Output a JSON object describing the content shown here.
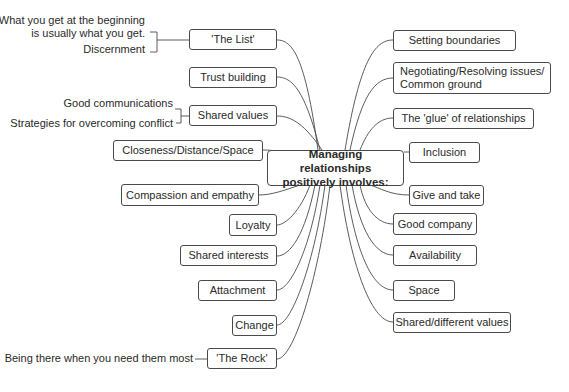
{
  "center": {
    "line1": "Managing relationships",
    "line2": "positively involves:"
  },
  "left_nodes": [
    {
      "label": "'The List'"
    },
    {
      "label": "Trust building"
    },
    {
      "label": "Shared values"
    },
    {
      "label": "Closeness/Distance/Space"
    },
    {
      "label": "Compassion and empathy"
    },
    {
      "label": "Loyalty"
    },
    {
      "label": "Shared interests"
    },
    {
      "label": "Attachment"
    },
    {
      "label": "Change"
    },
    {
      "label": "'The Rock'"
    }
  ],
  "right_nodes": [
    {
      "label": "Setting boundaries"
    },
    {
      "label": "Negotiating/Resolving issues/ Common ground"
    },
    {
      "label": "The 'glue' of relationships"
    },
    {
      "label": "Inclusion"
    },
    {
      "label": "Give and take"
    },
    {
      "label": "Good company"
    },
    {
      "label": "Availability"
    },
    {
      "label": "Space"
    },
    {
      "label": "Shared/different values"
    }
  ],
  "annotations": {
    "the_list": {
      "line1": "What you get at the beginning",
      "line2": "is usually what you get.",
      "line3": "Discernment"
    },
    "shared_values": {
      "line1": "Good communications",
      "line2": "Strategies for overcoming conflict"
    },
    "the_rock": {
      "line1": "Being there when you need them most"
    }
  },
  "colors": {
    "line": "#4a4a4a",
    "text": "#2a2a2a",
    "background": "#ffffff"
  }
}
